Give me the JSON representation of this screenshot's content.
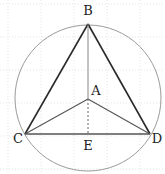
{
  "diagram": {
    "points": {
      "A": {
        "label": "A",
        "x": 88,
        "y": 99,
        "lx": 96,
        "ly": 95
      },
      "B": {
        "label": "B",
        "x": 88,
        "y": 24,
        "lx": 88,
        "ly": 15
      },
      "C": {
        "label": "C",
        "x": 25,
        "y": 134,
        "lx": 18,
        "ly": 143
      },
      "D": {
        "label": "D",
        "x": 150,
        "y": 134,
        "lx": 157,
        "ly": 143
      },
      "E": {
        "label": "E",
        "x": 88,
        "y": 134,
        "lx": 88,
        "ly": 150
      }
    },
    "circle": {
      "cx": 88,
      "cy": 98,
      "r": 73,
      "color": "#9a9a9a"
    },
    "segments": [
      {
        "from": "B",
        "to": "C",
        "style": "solid",
        "color": "#2a2a2a",
        "width": 1.6
      },
      {
        "from": "B",
        "to": "D",
        "style": "solid",
        "color": "#2a2a2a",
        "width": 1.6
      },
      {
        "from": "C",
        "to": "D",
        "style": "solid",
        "color": "#555555",
        "width": 1.3
      },
      {
        "from": "A",
        "to": "C",
        "style": "solid",
        "color": "#555555",
        "width": 1.1
      },
      {
        "from": "A",
        "to": "D",
        "style": "solid",
        "color": "#555555",
        "width": 1.1
      },
      {
        "from": "B",
        "to": "A",
        "style": "solid",
        "color": "#888888",
        "width": 1
      },
      {
        "from": "A",
        "to": "E",
        "style": "dashed",
        "color": "#666666",
        "width": 1
      }
    ],
    "grid": {
      "spacing": 33,
      "color": "#e4e4e4"
    }
  }
}
